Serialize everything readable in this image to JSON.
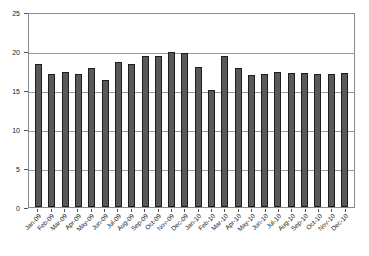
{
  "chart_data": {
    "type": "bar",
    "title": "",
    "subtitle": "",
    "xlabel": "",
    "ylabel": "",
    "ylim": [
      0,
      25
    ],
    "ytick_values": [
      25,
      20,
      15,
      10,
      5,
      0
    ],
    "ytick_labels": [
      "25",
      "20",
      "15",
      "10",
      "5",
      "0"
    ],
    "grid": true,
    "grid_axis": "y",
    "legend": false,
    "legend_position": "none",
    "bar_color": "#595959",
    "bar_edge_color": "#1e1e1e",
    "grid_color": "#9a9a9a",
    "frame_color": "#8a8a8a",
    "categories": [
      "Jan-09",
      "Feb-09",
      "Mar-09",
      "Apr-09",
      "May-09",
      "Jun-09",
      "Jul-09",
      "Aug-09",
      "Sep-09",
      "Oct-09",
      "Nov-09",
      "Dec-09",
      "Jan-10",
      "Feb-10",
      "Mar-10",
      "Apr-10",
      "May-10",
      "Jun-10",
      "Jul-10",
      "Aug-10",
      "Sep-10",
      "Oct-10",
      "Nov-10",
      "Dec-10"
    ],
    "values": [
      18.3,
      17.1,
      17.3,
      17.1,
      17.8,
      16.3,
      18.6,
      18.3,
      19.3,
      19.4,
      19.9,
      19.8,
      17.9,
      15.0,
      19.3,
      17.8,
      16.9,
      17.0,
      17.3,
      17.2,
      17.2,
      17.1,
      17.0,
      17.2
    ]
  }
}
